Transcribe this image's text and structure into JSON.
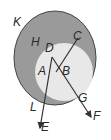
{
  "diagram": {
    "type": "venn-geometry",
    "colors": {
      "outer_fill": "#9a9a9a",
      "inner_fill": "#e8e8e8",
      "stroke": "#333333",
      "background": "#ffffff"
    },
    "labels": {
      "K": "K",
      "H": "H",
      "C": "C",
      "D": "D",
      "A": "A",
      "B": "B",
      "G": "G",
      "L": "L",
      "E": "E",
      "F": "F"
    },
    "regions": [
      {
        "name": "K",
        "description": "outer shaded region"
      },
      {
        "name": "H",
        "description": "shaded ring region label"
      },
      {
        "name": "inner",
        "description": "light inner region"
      }
    ],
    "rays": [
      {
        "from": "D",
        "to": "E",
        "through": "A"
      },
      {
        "from": "D",
        "to": "F",
        "through": "B"
      }
    ],
    "lines": [
      {
        "from": "C",
        "to": "F",
        "through": "B"
      }
    ]
  }
}
